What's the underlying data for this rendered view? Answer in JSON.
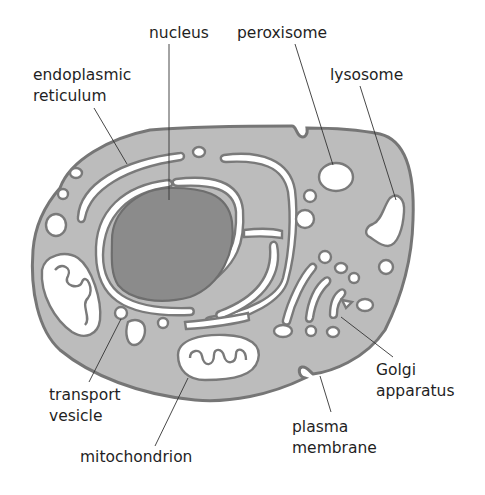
{
  "diagram": {
    "type": "cell-diagram",
    "colors": {
      "background": "#ffffff",
      "cytoplasm": "#bcbcbc",
      "membrane_outline": "#767676",
      "nucleus": "#8b8b8b",
      "lumen": "#ffffff",
      "label_text": "#1f1f1f"
    },
    "labels": {
      "nucleus": "nucleus",
      "peroxisome": "peroxisome",
      "er_line1": "endoplasmic",
      "er_line2": "reticulum",
      "lysosome": "lysosome",
      "golgi_line1": "Golgi",
      "golgi_line2": "apparatus",
      "transport_line1": "transport",
      "transport_line2": "vesicle",
      "plasma_line1": "plasma",
      "plasma_line2": "membrane",
      "mitochondrion": "mitochondrion"
    }
  }
}
